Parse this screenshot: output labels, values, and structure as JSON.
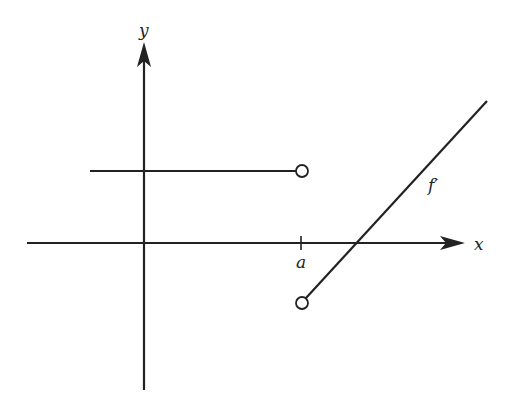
{
  "labels": {
    "y_axis": "y",
    "x_axis": "x",
    "tick_a": "a",
    "curve": "f′"
  },
  "colors": {
    "stroke": "#222222",
    "background": "#ffffff"
  },
  "diagram": {
    "segments": [
      {
        "name": "left-constant",
        "from": [
          90,
          171
        ],
        "to": [
          302,
          171
        ],
        "end": "open-circle"
      },
      {
        "name": "right-line",
        "from": [
          302,
          303
        ],
        "to": [
          487,
          101
        ],
        "start": "open-circle"
      }
    ]
  }
}
